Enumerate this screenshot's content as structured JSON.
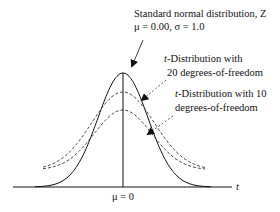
{
  "chart_data": {
    "type": "line",
    "title": "",
    "xlabel": "t",
    "center_label": "μ = 0",
    "x_range": [
      -4,
      4
    ],
    "series": [
      {
        "name": "Standard normal distribution, Z",
        "style": "solid",
        "distribution": "normal",
        "mu": 0.0,
        "sigma": 1.0
      },
      {
        "name": "t-Distribution with 20 degrees-of-freedom",
        "style": "dashed",
        "distribution": "t",
        "df": 20
      },
      {
        "name": "t-Distribution with 10 degrees-of-freedom",
        "style": "dashed",
        "distribution": "t",
        "df": 10
      }
    ],
    "annotations": [
      {
        "target": "normal",
        "lines": [
          "Standard normal distribution, Z",
          "μ = 0.00, σ = 1.0"
        ]
      },
      {
        "target": "t20",
        "lines": [
          "t-Distribution  with",
          "20 degrees-of-freedom"
        ],
        "italic_prefix": "t"
      },
      {
        "target": "t10",
        "lines": [
          "t-Distribution with 10",
          "degrees-of-freedom"
        ],
        "italic_prefix": "t"
      }
    ]
  },
  "labels": {
    "normal_line1": "Standard normal distribution, Z",
    "normal_line2": "μ = 0.00, σ = 1.0",
    "t20_italic": "t",
    "t20_line1_rest": "-Distribution  with",
    "t20_line2": "20 degrees-of-freedom",
    "t10_italic": "t",
    "t10_line1_rest": "-Distribution with 10",
    "t10_line2": "degrees-of-freedom",
    "mu_label": "μ = 0",
    "axis_label": "t"
  }
}
